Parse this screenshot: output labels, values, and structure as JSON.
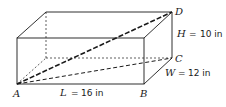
{
  "diagram": {
    "type": "rectangular-box",
    "vertices": {
      "A": "A",
      "B": "B",
      "C": "C",
      "D": "D"
    },
    "dimensions": {
      "length": {
        "var": "L",
        "eq": "=",
        "value": "16 in"
      },
      "width": {
        "var": "W",
        "eq": "=",
        "value": "12 in"
      },
      "height": {
        "var": "H",
        "eq": "=",
        "value": "10 in"
      }
    },
    "colors": {
      "stroke": "#1a1a1a",
      "background": "#ffffff"
    }
  }
}
